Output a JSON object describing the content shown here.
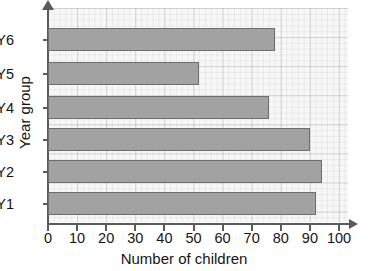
{
  "chart_data": {
    "type": "bar",
    "orientation": "horizontal",
    "title": "",
    "xlabel": "Number of children",
    "ylabel": "Year group",
    "categories": [
      "Y1",
      "Y2",
      "Y3",
      "Y4",
      "Y5",
      "Y6"
    ],
    "values": [
      92,
      94,
      90,
      76,
      52,
      78
    ],
    "xlim": [
      0,
      100
    ],
    "xticks": [
      0,
      10,
      20,
      30,
      40,
      50,
      60,
      70,
      80,
      90,
      100
    ],
    "xtick_labels": [
      "0",
      "10",
      "20",
      "30",
      "40",
      "50",
      "60",
      "70",
      "80",
      "90",
      "100"
    ],
    "grid": true,
    "grid_style": "graph-paper",
    "legend": null,
    "bar_fill_color": "#a2a2a2",
    "bar_border_color": "#6e6e6e",
    "axis_color": "#5a5a5a",
    "plot_background_color": "#f7f7f7",
    "page_background_color": "#ffffff",
    "text_color": "#141414",
    "bars": [
      {
        "category": "Y6",
        "value": 78
      },
      {
        "category": "Y5",
        "value": 52
      },
      {
        "category": "Y4",
        "value": 76
      },
      {
        "category": "Y3",
        "value": 90
      },
      {
        "category": "Y2",
        "value": 94
      },
      {
        "category": "Y1",
        "value": 92
      }
    ]
  }
}
